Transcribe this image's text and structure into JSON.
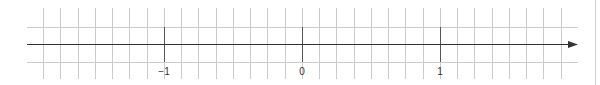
{
  "number_line": {
    "labels": [
      {
        "value": -1,
        "text": "−1",
        "x": 164
      },
      {
        "value": 0,
        "text": "0",
        "x": 302
      },
      {
        "value": 1,
        "text": "1",
        "x": 440
      }
    ],
    "min_visible": -1.875,
    "max_visible": 1.875,
    "subdivisions_per_unit": 8,
    "direction_arrow": "right"
  },
  "grid": {
    "first_vertical_x": 43,
    "cell_width": 17.25,
    "vertical_count": 31,
    "vertical_top": 8,
    "vertical_bottom": 79,
    "horizontal_lines_y": [
      27,
      44,
      62
    ],
    "horizontal_left": 27,
    "horizontal_right": 578,
    "axis_y": 44,
    "major_tick_indices": [
      7,
      15,
      23
    ]
  },
  "colors": {
    "grid": "#cccccc",
    "axis": "#333333",
    "major_tick": "#555555",
    "label": "#333333",
    "background": "#ffffff"
  }
}
